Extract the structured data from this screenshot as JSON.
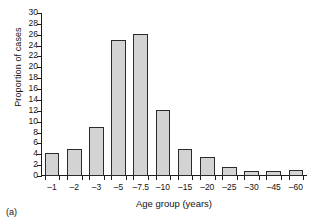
{
  "figure": {
    "panel_label": "(a)"
  },
  "chart_data": {
    "type": "bar",
    "title": "",
    "xlabel": "Age group (years)",
    "ylabel": "Proportion of cases",
    "categories": [
      "–1",
      "–2",
      "–3",
      "–5",
      "–7.5",
      "–10",
      "–15",
      "–20",
      "–25",
      "–30",
      "–45",
      "–60"
    ],
    "values": [
      4.2,
      5.0,
      9.0,
      25.0,
      26.2,
      12.1,
      5.0,
      3.5,
      1.6,
      1.0,
      1.0,
      1.1
    ],
    "ylim": [
      0,
      30
    ],
    "ytick_labels": [
      "0",
      "2",
      "4",
      "6",
      "8",
      "10",
      "12",
      "14",
      "16",
      "18",
      "20",
      "22",
      "24",
      "26",
      "28",
      "30"
    ],
    "ytick_values": [
      0,
      2,
      4,
      6,
      8,
      10,
      12,
      14,
      16,
      18,
      20,
      22,
      24,
      26,
      28,
      30
    ],
    "grid": false,
    "legend": "none",
    "bar_fill_color": "#d3d3d3",
    "bar_edge_color": "#2b2b2b",
    "axis_color": "#1c1c1c"
  }
}
